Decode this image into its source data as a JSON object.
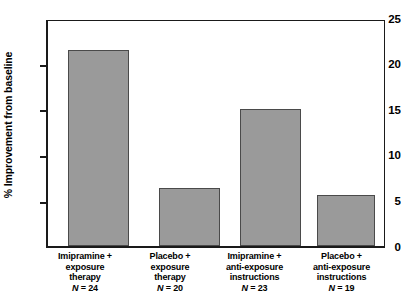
{
  "chart_data": {
    "type": "bar",
    "title": "",
    "xlabel": "",
    "ylabel": "% Improvement from baseline",
    "ylim": [
      0,
      25
    ],
    "yticks": [
      "0",
      "5",
      "10",
      "15",
      "20",
      "25"
    ],
    "ytick_values": [
      0,
      5,
      10,
      15,
      20,
      25
    ],
    "grid": false,
    "legend": false,
    "bar_color": "#9a9a9a",
    "bar_edge_color": "#4a4a4a",
    "axis_color": "#1a1a1a",
    "categories": [
      "Imipramine +\nexposure\ntherapy",
      "Placebo +\nexposure\ntherapy",
      "Imipramine +\nanti-exposure\ninstructions",
      "Placebo +\nanti-exposure\ninstructions"
    ],
    "values": [
      21.8,
      6.4,
      15.2,
      5.7
    ],
    "annotations": [
      "N = 24",
      "N = 20",
      "N = 23",
      "N = 19"
    ],
    "bars": [
      {
        "line1": "Imipramine +",
        "line2": "exposure",
        "line3": "therapy",
        "n_prefix": "N",
        "n_value": "= 24",
        "value": 21.8
      },
      {
        "line1": "Placebo +",
        "line2": "exposure",
        "line3": "therapy",
        "n_prefix": "N",
        "n_value": "= 20",
        "value": 6.4
      },
      {
        "line1": "Imipramine +",
        "line2": "anti-exposure",
        "line3": "instructions",
        "n_prefix": "N",
        "n_value": "= 23",
        "value": 15.2
      },
      {
        "line1": "Placebo +",
        "line2": "anti-exposure",
        "line3": "instructions",
        "n_prefix": "N",
        "n_value": "= 19",
        "value": 5.7
      }
    ]
  }
}
